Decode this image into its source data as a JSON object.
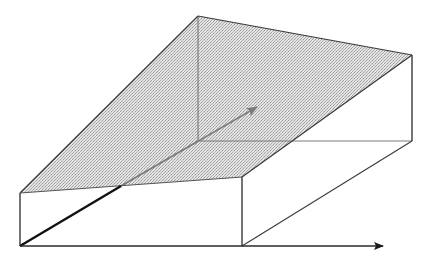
{
  "diagram": {
    "type": "3d-box-with-sloped-plane",
    "colors": {
      "background": "#ffffff",
      "edge": "#3a3a3a",
      "hidden_edge": "#777777",
      "plane_fill": "#d4d4d4",
      "axis": "#2a2a2a",
      "vector": "#808080"
    },
    "vertices": {
      "apex": [
        198,
        16
      ],
      "right_top": [
        412,
        55
      ],
      "right_back_bottom": [
        412,
        141
      ],
      "inner_back_bottom": [
        198,
        141
      ],
      "front_left_top": [
        20,
        193
      ],
      "front_left_bottom": [
        20,
        246
      ],
      "front_right_top": [
        242,
        177
      ],
      "front_right_bottom": [
        242,
        246
      ],
      "plane_cross": [
        121,
        186
      ],
      "x_axis_end": [
        383,
        246
      ],
      "vector_end": [
        257,
        107
      ]
    },
    "labels": []
  }
}
